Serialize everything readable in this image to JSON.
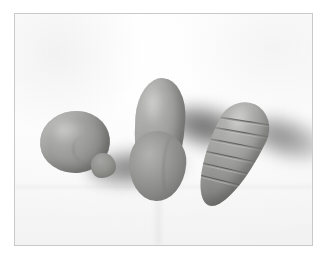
{
  "figure": {
    "caption": "",
    "frame": {
      "border_color": "#c9c9c9",
      "x": 14,
      "y": 13,
      "width": 299,
      "height": 233
    },
    "backdrop": {
      "name": "white paper surface",
      "base_color": "#fdfdfd",
      "shading_color": "#f0f0f0",
      "crease_color": "#d6d6d6"
    },
    "lighting": {
      "direction": "from upper-left",
      "shadow_direction": "falls to the right",
      "shadow_color": "#6e6e6e"
    },
    "objects": [
      {
        "id": "sphere",
        "label": "Clay sphere with small tapered nub",
        "shape": "sphere",
        "position": "left",
        "material": "grey modelling clay",
        "body_color": "#9a9a98",
        "highlight_color": "#bdbdbb",
        "shade_color": "#6d6d6b",
        "surface_marks": "faint seam line on the lower right",
        "shadow": {
          "name": "sphere-shadow",
          "offset": "right",
          "opacity": "0.80"
        }
      },
      {
        "id": "pear",
        "label": "Clay pear or teardrop form",
        "shape": "teardrop",
        "position": "centre",
        "material": "grey modelling clay",
        "body_color": "#9b9b99",
        "highlight_color": "#bdbdbb",
        "shade_color": "#6a6a68",
        "surface_marks": "soft crease down the right flank",
        "shadow": {
          "name": "pear-shadow",
          "offset": "right",
          "opacity": "0.85"
        }
      },
      {
        "id": "carrot",
        "label": "Clay carrot cone with incised ridges",
        "shape": "tapered cone",
        "position": "right",
        "material": "grey modelling clay",
        "body_color": "#9c9c9a",
        "highlight_color": "#bebebc",
        "shade_color": "#6b6b69",
        "surface_marks": "six diagonal incised grooves",
        "ridge_count": 6,
        "shadow": {
          "name": "carrot-shadow",
          "offset": "right",
          "opacity": "0.72"
        }
      }
    ]
  }
}
